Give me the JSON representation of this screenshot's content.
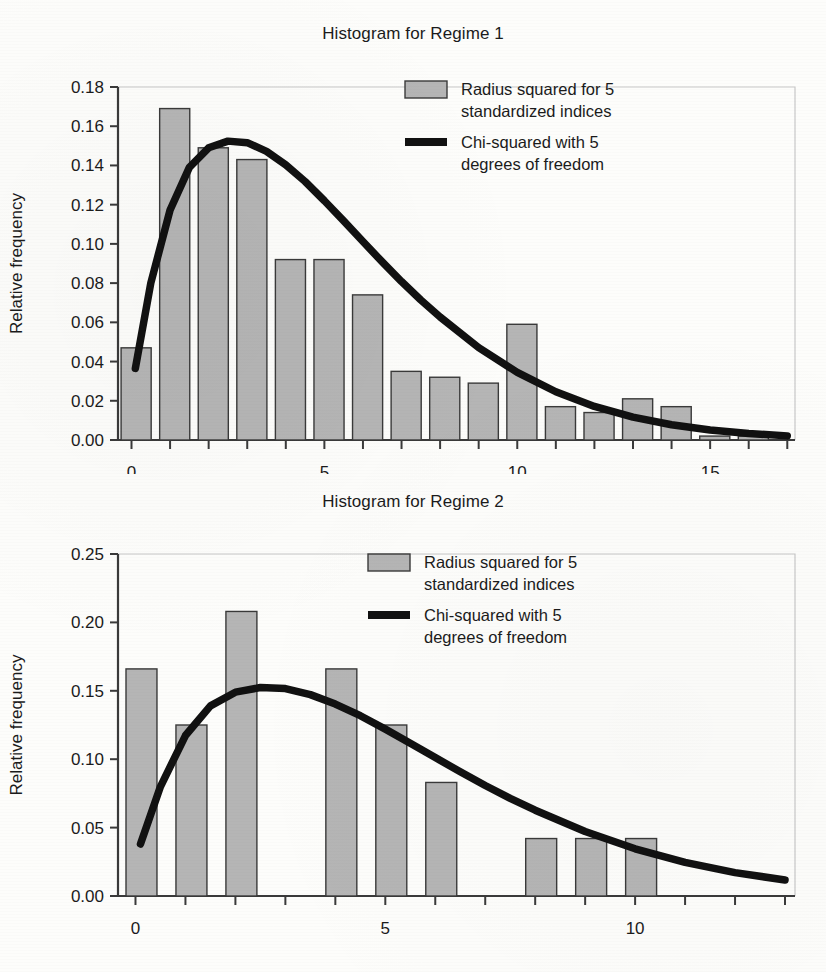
{
  "page": {
    "background_color": "#fdfdfb",
    "text_color": "#1a1a1a"
  },
  "style": {
    "bar_fill": "#b5b5b5",
    "bar_stroke": "#3a3a3a",
    "curve_color": "#111111",
    "axis_color": "#3a3a3a",
    "frame_color": "#c8c8c8"
  },
  "figures": [
    {
      "id": "regime-1",
      "title": "Histogram for Regime 1",
      "ylabel": "Relative frequency",
      "legend": {
        "position": "top-right",
        "entries": [
          {
            "marker": "bar-swatch",
            "label_line1": "Radius squared for 5",
            "label_line2": "standardized indices"
          },
          {
            "marker": "line-swatch",
            "label_line1": "Chi-squared with 5",
            "label_line2": "degrees of freedom"
          }
        ]
      }
    },
    {
      "id": "regime-2",
      "title": "Histogram for Regime 2",
      "ylabel": "Relative frequency",
      "legend": {
        "position": "top-right",
        "entries": [
          {
            "marker": "bar-swatch",
            "label_line1": "Radius squared for 5",
            "label_line2": "standardized indices"
          },
          {
            "marker": "line-swatch",
            "label_line1": "Chi-squared with 5",
            "label_line2": "degrees of freedom"
          }
        ]
      }
    }
  ],
  "chart_data": [
    {
      "type": "bar",
      "id": "regime-1",
      "title": "Histogram for Regime 1",
      "xlabel": "",
      "ylabel": "Relative frequency",
      "xlim": [
        -0.35,
        17.2
      ],
      "ylim": [
        0.0,
        0.18
      ],
      "xticks": [
        0,
        1,
        2,
        3,
        4,
        5,
        6,
        7,
        8,
        9,
        10,
        11,
        12,
        13,
        14,
        15,
        16,
        17
      ],
      "xtick_labels_shown": [
        "0",
        "5",
        "10",
        "15"
      ],
      "xtick_labels_shown_at": [
        0,
        5,
        10,
        15
      ],
      "yticks": [
        0.0,
        0.02,
        0.04,
        0.06,
        0.08,
        0.1,
        0.12,
        0.14,
        0.16,
        0.18
      ],
      "ytick_labels": [
        "0.00",
        "0.02",
        "0.04",
        "0.06",
        "0.08",
        "0.10",
        "0.12",
        "0.14",
        "0.16",
        "0.18"
      ],
      "grid": false,
      "legend_position": "top-right",
      "series": [
        {
          "name": "Radius squared for 5 standardized indices",
          "kind": "bar",
          "categories": [
            0,
            1,
            2,
            3,
            4,
            5,
            6,
            7,
            8,
            9,
            10,
            11,
            12,
            13,
            14,
            15,
            16
          ],
          "values": [
            0.047,
            0.169,
            0.149,
            0.143,
            0.092,
            0.092,
            0.074,
            0.035,
            0.032,
            0.029,
            0.059,
            0.017,
            0.014,
            0.021,
            0.017,
            0.002,
            0.002
          ]
        },
        {
          "name": "Chi-squared with 5 degrees of freedom",
          "kind": "line",
          "x": [
            0.1,
            0.5,
            1.0,
            1.5,
            2.0,
            2.5,
            3.0,
            3.5,
            4.0,
            4.5,
            5.0,
            5.5,
            6.0,
            6.5,
            7.0,
            7.5,
            8.0,
            9.0,
            10.0,
            11.0,
            12.0,
            13.0,
            14.0,
            15.0,
            16.0,
            17.0
          ],
          "y": [
            0.0365,
            0.08,
            0.1173,
            0.139,
            0.149,
            0.1524,
            0.1516,
            0.1472,
            0.1403,
            0.1318,
            0.122,
            0.1117,
            0.1012,
            0.0908,
            0.0808,
            0.0714,
            0.0627,
            0.0471,
            0.0345,
            0.0246,
            0.0171,
            0.0117,
            0.0078,
            0.0051,
            0.0033,
            0.0021
          ]
        }
      ]
    },
    {
      "type": "bar",
      "id": "regime-2",
      "title": "Histogram for Regime 2",
      "xlabel": "",
      "ylabel": "Relative frequency",
      "xlim": [
        -0.35,
        13.2
      ],
      "ylim": [
        0.0,
        0.25
      ],
      "xticks": [
        0,
        1,
        2,
        3,
        4,
        5,
        6,
        7,
        8,
        9,
        10,
        11,
        12,
        13
      ],
      "xtick_labels_shown": [
        "0",
        "5",
        "10"
      ],
      "xtick_labels_shown_at": [
        0,
        5,
        10
      ],
      "yticks": [
        0.0,
        0.05,
        0.1,
        0.15,
        0.2,
        0.25
      ],
      "ytick_labels": [
        "0.00",
        "0.05",
        "0.10",
        "0.15",
        "0.20",
        "0.25"
      ],
      "grid": false,
      "legend_position": "top-right",
      "series": [
        {
          "name": "Radius squared for 5 standardized indices",
          "kind": "bar",
          "categories": [
            0,
            1,
            2,
            3,
            4,
            5,
            6,
            7,
            8,
            9,
            10
          ],
          "values": [
            0.166,
            0.125,
            0.208,
            0.0,
            0.166,
            0.125,
            0.083,
            0.0,
            0.042,
            0.042,
            0.042
          ]
        },
        {
          "name": "Chi-squared with 5 degrees of freedom",
          "kind": "line",
          "x": [
            0.1,
            0.5,
            1.0,
            1.5,
            2.0,
            2.5,
            3.0,
            3.5,
            4.0,
            4.5,
            5.0,
            5.5,
            6.0,
            6.5,
            7.0,
            7.5,
            8.0,
            9.0,
            10.0,
            11.0,
            12.0,
            13.0
          ],
          "y": [
            0.038,
            0.08,
            0.1173,
            0.139,
            0.149,
            0.1524,
            0.1516,
            0.1472,
            0.1403,
            0.1318,
            0.122,
            0.1117,
            0.1012,
            0.0908,
            0.0808,
            0.0714,
            0.0627,
            0.0471,
            0.0345,
            0.0246,
            0.0171,
            0.0117
          ]
        }
      ]
    }
  ]
}
